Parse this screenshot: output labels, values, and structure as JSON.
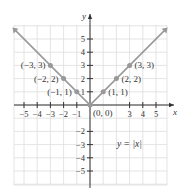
{
  "chart_data": {
    "type": "line",
    "title": "",
    "function_label": "y = |x|",
    "xlabel": "x",
    "ylabel": "y",
    "xlim": [
      -5.8,
      5.8
    ],
    "ylim": [
      -6.1,
      6.1
    ],
    "grid": true,
    "x_ticks": [
      -5,
      -4,
      -3,
      -2,
      -1,
      3,
      4,
      5
    ],
    "x_tick_labels": [
      "−5",
      "−4",
      "−3",
      "−2",
      "−1",
      "3",
      "4",
      "5"
    ],
    "y_ticks": [
      5,
      4,
      3,
      2,
      1,
      -2,
      -3,
      -4,
      -5
    ],
    "y_tick_labels": [
      "5",
      "4",
      "3",
      "2",
      "1",
      "−2",
      "−3",
      "−4",
      "−5"
    ],
    "series": [
      {
        "name": "y = |x|",
        "x": [
          -5.8,
          0,
          5.8
        ],
        "y": [
          5.8,
          0,
          5.8
        ]
      }
    ],
    "points": [
      {
        "x": -3,
        "y": 3,
        "label": "(−3, 3)"
      },
      {
        "x": -2,
        "y": 2,
        "label": "(−2, 2)"
      },
      {
        "x": -1,
        "y": 1,
        "label": "(−1, 1)"
      },
      {
        "x": 0,
        "y": 0,
        "label": "(0, 0)"
      },
      {
        "x": 1,
        "y": 1,
        "label": "(1, 1)"
      },
      {
        "x": 2,
        "y": 2,
        "label": "(2, 2)"
      },
      {
        "x": 3,
        "y": 3,
        "label": "(3, 3)"
      }
    ]
  },
  "colors": {
    "line": "#999999",
    "grid": "#dddddd",
    "axis": "#333333",
    "point": "#999999"
  }
}
